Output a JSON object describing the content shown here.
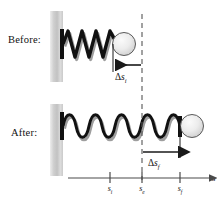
{
  "figure": {
    "type": "physics-diagram",
    "background_color": "#ffffff",
    "ink_color": "#111111"
  },
  "panels": [
    {
      "id": "before",
      "label": "Before:",
      "spring_state": "compressed",
      "spring_coils": 6,
      "ball_position_label": "s_i",
      "displacement": {
        "label_delta": "Δ",
        "label_var": "s",
        "label_sub": "i",
        "direction": "left",
        "from_tick": "s_e",
        "to_tick": "s_i"
      }
    },
    {
      "id": "after",
      "label": "After:",
      "spring_state": "stretched",
      "spring_coils": 6,
      "ball_position_label": "s_f",
      "displacement": {
        "label_delta": "Δ",
        "label_var": "s",
        "label_sub": "f",
        "direction": "right",
        "from_tick": "s_e",
        "to_tick": "s_f"
      }
    }
  ],
  "axis": {
    "name": "s",
    "axis_label": "s",
    "ticks": [
      {
        "var": "s",
        "sub": "i",
        "x": 110
      },
      {
        "var": "s",
        "sub": "e",
        "x": 142
      },
      {
        "var": "s",
        "sub": "f",
        "x": 180
      }
    ]
  },
  "guides": {
    "equilibrium_dashed_line": {
      "x": 142,
      "label": "s_e"
    }
  },
  "colors": {
    "wall_light": "#e8e8e8",
    "wall_mid": "#bdbdbd",
    "wall_dark": "#d6d6d6",
    "spring": "#111111",
    "spring_shadow": "#9a9a9a",
    "ball_light": "#f2f2f2",
    "ball_mid": "#d8d8d8",
    "ball_outline": "#4a4a4a",
    "axis": "#4a4a4a",
    "dash": "#555555"
  }
}
